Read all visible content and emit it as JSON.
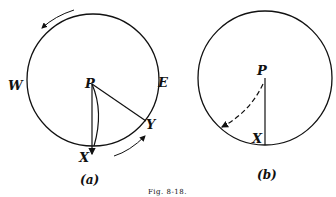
{
  "figure": {
    "caption": "Fig. 8-18.",
    "panel_a": {
      "label": "(a)",
      "points": {
        "P": "P",
        "W": "W",
        "E": "E",
        "X": "X",
        "Y": "Y"
      }
    },
    "panel_b": {
      "label": "(b)",
      "points": {
        "P": "P",
        "X": "X"
      }
    }
  }
}
